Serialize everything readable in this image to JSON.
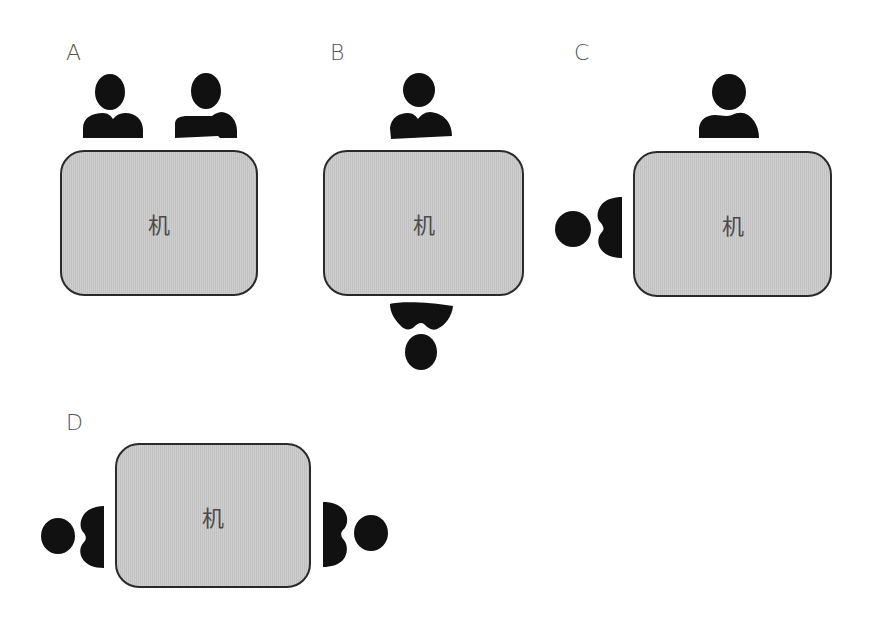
{
  "diagram": {
    "type": "seating-arrangement",
    "colors": {
      "table_fill": "#c9c9c9",
      "table_border": "#2a2a2a",
      "person_fill": "#111111",
      "label_text": "#555555"
    },
    "panels": [
      {
        "id": "A",
        "label": "A",
        "table_label": "机",
        "seating": "two people side by side on the top (same side)",
        "persons": [
          {
            "position": "top-left",
            "facing": "table"
          },
          {
            "position": "top-right",
            "facing": "table"
          }
        ]
      },
      {
        "id": "B",
        "label": "B",
        "table_label": "机",
        "seating": "facing each other across the long sides",
        "persons": [
          {
            "position": "top",
            "facing": "table"
          },
          {
            "position": "bottom",
            "facing": "table"
          }
        ]
      },
      {
        "id": "C",
        "label": "C",
        "table_label": "机",
        "seating": "corner seating (top and left side)",
        "persons": [
          {
            "position": "top",
            "facing": "table"
          },
          {
            "position": "left",
            "facing": "table"
          }
        ]
      },
      {
        "id": "D",
        "label": "D",
        "table_label": "机",
        "seating": "facing each other across the short sides",
        "persons": [
          {
            "position": "left",
            "facing": "table"
          },
          {
            "position": "right",
            "facing": "table"
          }
        ]
      }
    ]
  }
}
